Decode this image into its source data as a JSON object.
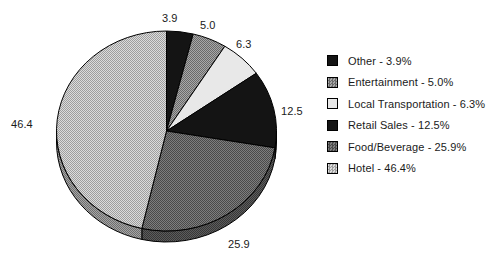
{
  "chart_data": {
    "type": "pie",
    "title": "",
    "categories": [
      "Other",
      "Entertainment",
      "Local Transportation",
      "Retail Sales",
      "Food/Beverage",
      "Hotel"
    ],
    "values": [
      3.9,
      5.0,
      6.3,
      12.5,
      25.9,
      46.4
    ],
    "value_unit": "%",
    "legend_position": "right",
    "grid": false,
    "three_d": true,
    "start_angle_deg": 0,
    "direction": "clockwise",
    "slices": [
      {
        "label": "Other",
        "value": 3.9,
        "value_text": "3.9",
        "legend_text": "Other - 3.9%",
        "fill": "solid-black",
        "color": "#121212"
      },
      {
        "label": "Entertainment",
        "value": 5.0,
        "value_text": "5.0",
        "legend_text": "Entertainment - 5.0%",
        "fill": "dither-mid",
        "color": "#8a8a8a"
      },
      {
        "label": "Local Transportation",
        "value": 6.3,
        "value_text": "6.3",
        "legend_text": "Local Transportation - 6.3%",
        "fill": "solid-light",
        "color": "#e2e2e2"
      },
      {
        "label": "Retail Sales",
        "value": 12.5,
        "value_text": "12.5",
        "legend_text": "Retail Sales - 12.5%",
        "fill": "solid-black",
        "color": "#121212"
      },
      {
        "label": "Food/Beverage",
        "value": 25.9,
        "value_text": "25.9",
        "legend_text": "Food/Beverage - 25.9%",
        "fill": "dither-dark",
        "color": "#6e6e6e"
      },
      {
        "label": "Hotel",
        "value": 46.4,
        "value_text": "46.4",
        "legend_text": "Hotel - 46.4%",
        "fill": "dither-light",
        "color": "#c6c6c6"
      }
    ],
    "value_labels": [
      {
        "text": "3.9",
        "x": 162,
        "y": 12
      },
      {
        "text": "5.0",
        "x": 200,
        "y": 19
      },
      {
        "text": "6.3",
        "x": 236,
        "y": 38
      },
      {
        "text": "12.5",
        "x": 281,
        "y": 105
      },
      {
        "text": "25.9",
        "x": 228,
        "y": 238
      },
      {
        "text": "46.4",
        "x": 11,
        "y": 118
      }
    ],
    "colors": {
      "outline": "#000000",
      "background": "#ffffff",
      "text": "#1a1a1a"
    }
  }
}
